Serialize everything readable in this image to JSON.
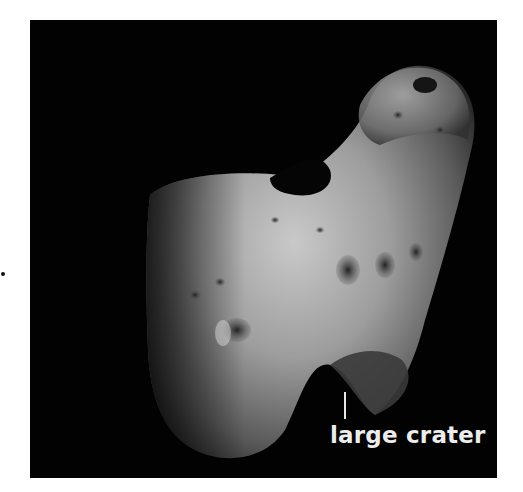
{
  "figure": {
    "annotation": {
      "label": "large crater"
    },
    "colors": {
      "background": "#020202",
      "label": "#ececec",
      "page": "#ffffff"
    }
  }
}
